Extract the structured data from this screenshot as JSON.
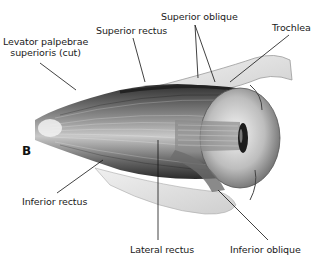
{
  "figure": {
    "panel_letter": "B",
    "labels": {
      "levator": [
        "Levator palpebrae",
        "superioris (cut)"
      ],
      "superior_rectus": "Superior rectus",
      "superior_oblique": "Superior oblique",
      "trochlea": "Trochlea",
      "inferior_rectus": "Inferior rectus",
      "lateral_rectus": "Lateral rectus",
      "inferior_oblique": "Inferior oblique"
    },
    "colors": {
      "background": "#ffffff",
      "ink": "#1a1a1a",
      "muscle_dark": "#3a3a3a",
      "muscle_mid": "#8a8a8a",
      "muscle_light": "#d6d6d6",
      "bone": "#e4e4e4"
    }
  }
}
